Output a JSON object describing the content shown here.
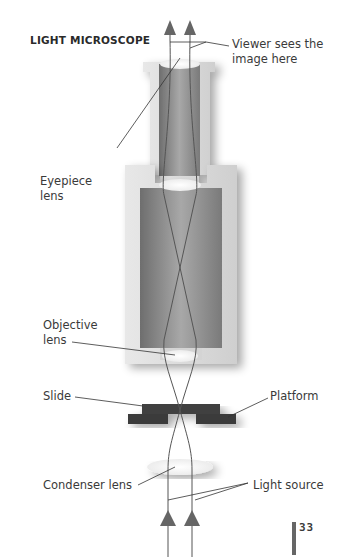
{
  "diagram": {
    "title": "LIGHT MICROSCOPE",
    "labels": {
      "viewer": "Viewer sees the\nimage here",
      "eyepiece": "Eyepiece\nlens",
      "objective": "Objective\nlens",
      "slide": "Slide",
      "platform": "Platform",
      "condenser": "Condenser lens",
      "light_source": "Light source"
    },
    "page_number": "33",
    "colors": {
      "tube_wall": "#d8d8d8",
      "tube_inner": "#8a8a8a",
      "slide": "#3f3f3f",
      "ray": "#555555",
      "arrow": "#666666",
      "page_bar": "#666666"
    }
  }
}
